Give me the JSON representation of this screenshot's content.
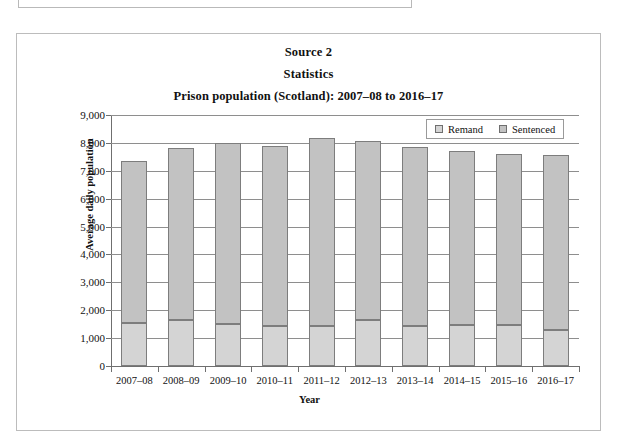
{
  "panel": {
    "source_label": "Source 2",
    "source_subtitle": "Statistics"
  },
  "chart_data": {
    "type": "bar",
    "subtype": "stacked-column",
    "title": "Prison population (Scotland): 2007–08 to 2016–17",
    "xlabel": "Year",
    "ylabel": "Average daily population",
    "ylim": [
      0,
      9000
    ],
    "ytick_step": 1000,
    "yticks": [
      "0",
      "1,000",
      "2,000",
      "3,000",
      "4,000",
      "5,000",
      "6,000",
      "7,000",
      "8,000",
      "9,000"
    ],
    "ytick_values": [
      0,
      1000,
      2000,
      3000,
      4000,
      5000,
      6000,
      7000,
      8000,
      9000
    ],
    "grid": true,
    "legend_position": "top-right",
    "categories": [
      "2007–08",
      "2008–09",
      "2009–10",
      "2010–11",
      "2011–12",
      "2012–13",
      "2013–14",
      "2014–15",
      "2015–16",
      "2016–17"
    ],
    "series": [
      {
        "name": "Remand",
        "color": "#d4d4d4",
        "values": [
          1550,
          1650,
          1500,
          1420,
          1420,
          1650,
          1420,
          1480,
          1470,
          1300
        ]
      },
      {
        "name": "Sentenced",
        "color": "#c2c2c2",
        "values": [
          5800,
          6150,
          6500,
          6460,
          6760,
          6430,
          6430,
          6240,
          6150,
          6250
        ]
      }
    ],
    "totals": [
      7350,
      7800,
      8000,
      7880,
      8180,
      8080,
      7850,
      7720,
      7620,
      7550
    ]
  }
}
